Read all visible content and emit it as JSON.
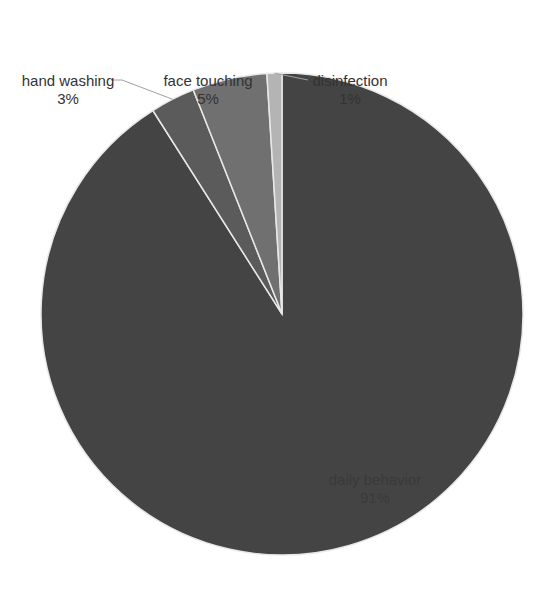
{
  "chart_data": {
    "type": "pie",
    "title": "",
    "start_angle_deg": 0,
    "direction": "clockwise",
    "slices": [
      {
        "name": "daily behavior",
        "value": 91,
        "label": "daily behavior",
        "pct_label": "91%",
        "color": "#444444"
      },
      {
        "name": "hand washing",
        "value": 3,
        "label": "hand washing",
        "pct_label": "3%",
        "color": "#5b5b5b"
      },
      {
        "name": "face touching",
        "value": 5,
        "label": "face touching",
        "pct_label": "5%",
        "color": "#707070"
      },
      {
        "name": "disinfection",
        "value": 1,
        "label": "disinfection",
        "pct_label": "1%",
        "color": "#b4b4b4"
      }
    ],
    "legend": "none",
    "data_labels": "category name and percentage"
  },
  "layout": {
    "cx": 282,
    "cy": 314,
    "r": 241,
    "separator_color": "#e8e8e8"
  }
}
